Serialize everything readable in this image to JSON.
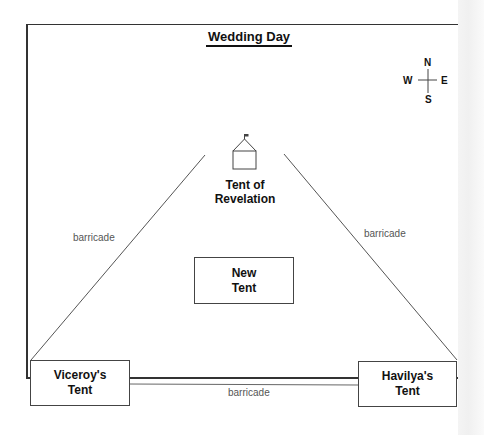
{
  "diagram": {
    "title": "Wedding Day",
    "compass": {
      "north": "N",
      "south": "S",
      "east": "E",
      "west": "W"
    },
    "tent_of_revelation": {
      "line1": "Tent of",
      "line2": "Revelation"
    },
    "new_tent": {
      "line1": "New",
      "line2": "Tent"
    },
    "viceroys_tent": {
      "line1": "Viceroy's",
      "line2": "Tent"
    },
    "havilyas_tent": {
      "line1": "Havilya's",
      "line2": "Tent"
    },
    "barricades": {
      "left": "barricade",
      "right": "barricade",
      "bottom": "barricade"
    },
    "colors": {
      "line": "#444444",
      "text": "#111111",
      "barricade_text": "#555555"
    }
  }
}
